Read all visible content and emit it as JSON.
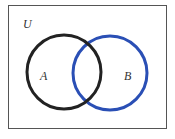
{
  "diagram": {
    "type": "venn",
    "universe_label": "U",
    "sets": [
      {
        "label": "A",
        "color": "#222222",
        "cx": 64,
        "cy": 72,
        "r": 37
      },
      {
        "label": "B",
        "color": "#2a4fb5",
        "cx": 110,
        "cy": 73,
        "r": 37
      }
    ],
    "frame_color": "#555555"
  }
}
